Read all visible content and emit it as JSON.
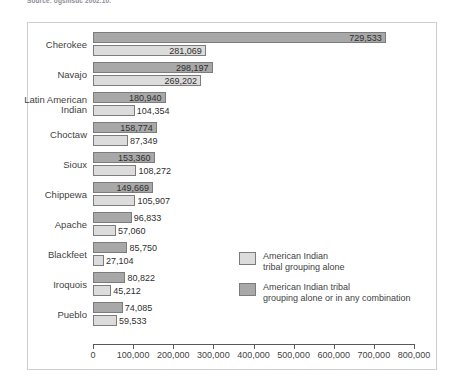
{
  "source_note": "Source: ogsmsdc 2002.10.",
  "legend": {
    "items": [
      {
        "key": "alone",
        "label": "American Indian\ntribal grouping alone",
        "color": "#dcdcdc"
      },
      {
        "key": "combination",
        "label": "American Indian tribal\ngrouping alone or in any combination",
        "color": "#a8a8a8"
      }
    ]
  },
  "axis": {
    "tick_labels": [
      "0",
      "100,000",
      "200,000",
      "300,000",
      "400,000",
      "500,000",
      "600,000",
      "700,000",
      "800,000"
    ]
  },
  "chart_data": {
    "type": "bar",
    "orientation": "horizontal",
    "title": "",
    "xlabel": "",
    "ylabel": "",
    "xlim": [
      0,
      800000
    ],
    "xticks": [
      0,
      100000,
      200000,
      300000,
      400000,
      500000,
      600000,
      700000,
      800000
    ],
    "grid": false,
    "legend_position": "inside-right",
    "categories": [
      "Cherokee",
      "Navajo",
      "Latin American\nIndian",
      "Choctaw",
      "Sioux",
      "Chippewa",
      "Apache",
      "Blackfeet",
      "Iroquois",
      "Pueblo"
    ],
    "series": [
      {
        "name": "American Indian tribal grouping alone or in any combination",
        "color": "#a8a8a8",
        "values": [
          729533,
          298197,
          180940,
          158774,
          153360,
          149669,
          96833,
          85750,
          80822,
          74085
        ],
        "labels": [
          "729,533",
          "298,197",
          "180,940",
          "158,774",
          "153,360",
          "149,669",
          "96,833",
          "85,750",
          "80,822",
          "74,085"
        ]
      },
      {
        "name": "American Indian tribal grouping alone",
        "color": "#dcdcdc",
        "values": [
          281069,
          269202,
          104354,
          87349,
          108272,
          105907,
          57060,
          27104,
          45212,
          59533
        ],
        "labels": [
          "281,069",
          "269,202",
          "104,354",
          "87,349",
          "108,272",
          "105,907",
          "57,060",
          "27,104",
          "45,212",
          "59,533"
        ]
      }
    ]
  }
}
